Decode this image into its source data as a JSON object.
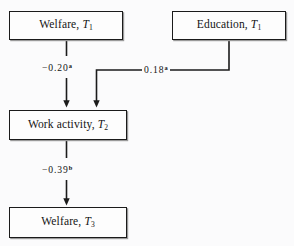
{
  "figure": {
    "type": "path-diagram",
    "background_color": "#fbfbfc",
    "line_color": "#1b1b1b",
    "nodes": [
      {
        "id": "welfare-t1",
        "text_main": "Welfare,",
        "var": "T",
        "sub": "1"
      },
      {
        "id": "education-t1",
        "text_main": "Education,",
        "var": "T",
        "sub": "1"
      },
      {
        "id": "work-t2",
        "text_main": "Work activity,",
        "var": "T",
        "sub": "2"
      },
      {
        "id": "welfare-t3",
        "text_main": "Welfare,",
        "var": "T",
        "sub": "3"
      }
    ],
    "edges": [
      {
        "id": "welfare-t1-to-work-t2",
        "from": "welfare-t1",
        "to": "work-t2",
        "coefficient": "−0.20",
        "significance": "a"
      },
      {
        "id": "education-t1-to-work-t2",
        "from": "education-t1",
        "to": "work-t2",
        "coefficient": "0.18",
        "significance": "a"
      },
      {
        "id": "work-t2-to-welfare-t3",
        "from": "work-t2",
        "to": "welfare-t3",
        "coefficient": "−0.39",
        "significance": "b"
      }
    ]
  },
  "nodes": {
    "welfare_t1": {
      "main": "Welfare,",
      "var": "T",
      "sub": "1"
    },
    "education_t1": {
      "main": "Education,",
      "var": "T",
      "sub": "1"
    },
    "work_t2": {
      "main": "Work activity,",
      "var": "T",
      "sub": "2"
    },
    "welfare_t3": {
      "main": "Welfare,",
      "var": "T",
      "sub": "3"
    }
  },
  "edge_labels": {
    "welfare_to_work": {
      "value": "−0.20",
      "note": "a"
    },
    "education_to_work": {
      "value": "0.18",
      "note": "a"
    },
    "work_to_welfare": {
      "value": "−0.39",
      "note": "b"
    }
  }
}
